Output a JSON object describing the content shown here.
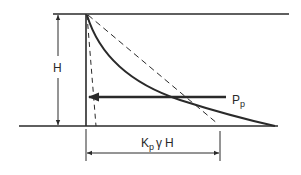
{
  "diagram": {
    "labels": {
      "height": "H",
      "force": "P",
      "force_sub": "p",
      "base_k": "K",
      "base_k_sub": "p",
      "base_gamma": "γ",
      "base_h": "H"
    },
    "colors": {
      "line": "#2a2a2a",
      "background": "#ffffff"
    },
    "elements": {
      "top_surface": {
        "x1": 53,
        "y1": 14,
        "x2": 289,
        "y2": 14
      },
      "wall": {
        "x1": 86,
        "y1": 14,
        "x2": 86,
        "y2": 126
      },
      "ground_base": {
        "x1": 19,
        "y1": 126,
        "x2": 278,
        "y2": 126
      },
      "curve_end": {
        "x": 275,
        "y": 126
      },
      "dashed_linear_end": {
        "x": 218,
        "y": 124
      },
      "dashed_steep_end": {
        "x": 96,
        "y": 126
      },
      "force_arrow": {
        "x_from": 226,
        "x_to": 88,
        "y": 97
      },
      "height_dim_x": 58,
      "base_dim": {
        "x1": 86,
        "x2": 220,
        "y": 153
      }
    }
  }
}
